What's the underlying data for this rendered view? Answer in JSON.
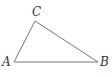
{
  "diagram": {
    "type": "triangle",
    "stroke_color": "#777777",
    "vertices": [
      {
        "name": "A",
        "label": "A",
        "x": 14,
        "y": 62,
        "label_x": 2,
        "label_y": 66
      },
      {
        "name": "B",
        "label": "B",
        "x": 98,
        "y": 62,
        "label_x": 100,
        "label_y": 66
      },
      {
        "name": "C",
        "label": "C",
        "x": 35,
        "y": 21,
        "label_x": 32,
        "label_y": 16
      }
    ]
  }
}
